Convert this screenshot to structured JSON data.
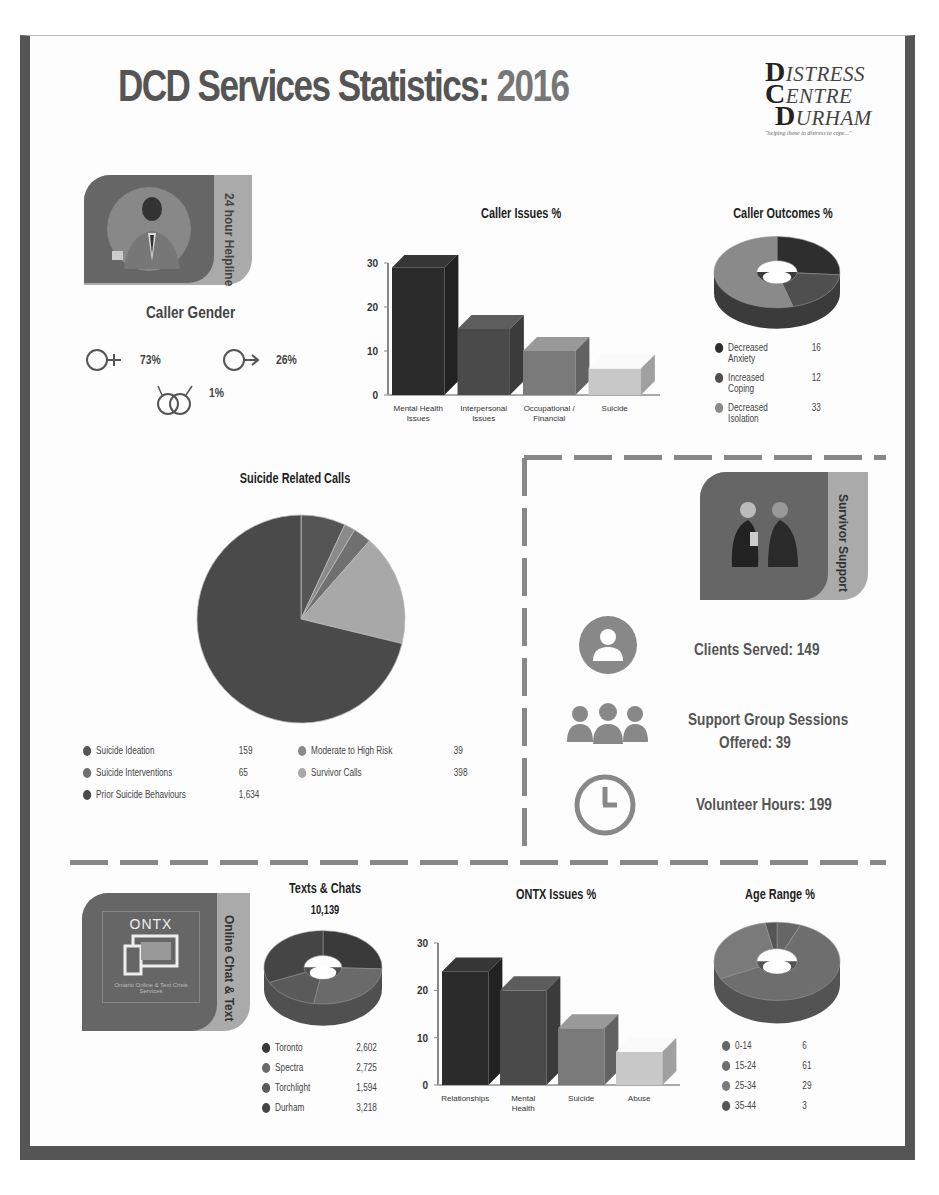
{
  "header": {
    "title": "DCD Services Statistics:",
    "year": "2016",
    "logo_line1": "ISTRESS",
    "logo_line2": "ENTRE",
    "logo_line3": "URHAM",
    "logo_initial1": "D",
    "logo_initial2": "C",
    "logo_initial3": "D",
    "logo_tagline": "\"helping those in distress to cope...\""
  },
  "helpline": {
    "badge_label": "24 hour Helpline",
    "gender_title": "Caller Gender",
    "female_pct": "73%",
    "male_pct": "26%",
    "other_pct": "1%"
  },
  "survivor": {
    "badge_label": "Survivor Support",
    "clients_served": "Clients Served:  149",
    "group_sessions_line1": "Support Group Sessions",
    "group_sessions_line2": "Offered:  39",
    "volunteer_hours": "Volunteer Hours:  199"
  },
  "ontx": {
    "badge_label": "Online Chat & Text",
    "logo_text": "ONTX",
    "logo_sub": "Ontario Online & Text Crisis Services"
  },
  "chart_data": [
    {
      "id": "caller_issues",
      "type": "bar",
      "title": "Caller Issues %",
      "categories": [
        "Mental Health Issues",
        "Interpersonal Issues",
        "Occupational / Financial",
        "Suicide"
      ],
      "values": [
        29,
        15,
        10,
        6
      ],
      "yticks": [
        "30",
        "20",
        "10",
        "0"
      ],
      "ylim": [
        0,
        30
      ],
      "colors": [
        "#2b2b2b",
        "#4a4a4a",
        "#7a7a7a",
        "#c8c8c8"
      ],
      "grid": false
    },
    {
      "id": "caller_outcomes",
      "type": "pie",
      "style": "3d-donut",
      "title": "Caller Outcomes %",
      "labels": [
        "Decreased Anxiety",
        "Increased Coping",
        "Decreased Isolation"
      ],
      "values": [
        16,
        12,
        33
      ],
      "colors": [
        "#2e2e2e",
        "#4f4f4f",
        "#8a8a8a"
      ],
      "legend_position": "bottom"
    },
    {
      "id": "suicide_calls",
      "type": "pie",
      "title": "Suicide Related Calls",
      "labels": [
        "Suicide Ideation",
        "Suicide Interventions",
        "Prior Suicide Behaviours",
        "Moderate to High Risk",
        "Survivor Calls"
      ],
      "values": [
        159,
        65,
        1634,
        39,
        398
      ],
      "value_labels": [
        "159",
        "65",
        "1,634",
        "39",
        "398"
      ],
      "colors": [
        "#555555",
        "#707070",
        "#4a4a4a",
        "#8a8a8a",
        "#a8a8a8"
      ],
      "legend_position": "bottom"
    },
    {
      "id": "texts_chats",
      "type": "pie",
      "style": "3d-donut",
      "title": "Texts & Chats",
      "subtitle": "10,139",
      "labels": [
        "Toronto",
        "Spectra",
        "Torchlight",
        "Durham"
      ],
      "values": [
        2602,
        2725,
        1594,
        3218
      ],
      "value_labels": [
        "2,602",
        "2,725",
        "1,594",
        "3,218"
      ],
      "colors": [
        "#3a3a3a",
        "#6a6a6a",
        "#5a5a5a",
        "#454545"
      ],
      "legend_position": "bottom"
    },
    {
      "id": "ontx_issues",
      "type": "bar",
      "title": "ONTX Issues %",
      "categories": [
        "Relationships",
        "Mental Health",
        "Suicide",
        "Abuse"
      ],
      "values": [
        24,
        20,
        12,
        7
      ],
      "yticks": [
        "30",
        "20",
        "10",
        "0"
      ],
      "ylim": [
        0,
        30
      ],
      "colors": [
        "#2b2b2b",
        "#4a4a4a",
        "#7a7a7a",
        "#c8c8c8"
      ],
      "grid": false
    },
    {
      "id": "age_range",
      "type": "pie",
      "style": "3d-donut",
      "title": "Age Range %",
      "labels": [
        "0-14",
        "15-24",
        "25-34",
        "35-44"
      ],
      "values": [
        6,
        61,
        29,
        3
      ],
      "colors": [
        "#666666",
        "#6e6e6e",
        "#7a7a7a",
        "#555555"
      ],
      "legend_position": "bottom"
    }
  ]
}
